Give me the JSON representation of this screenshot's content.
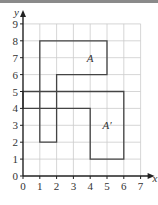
{
  "diagram": {
    "type": "coordinate-grid-transformation",
    "x_axis": {
      "label": "x",
      "ticks": [
        "0",
        "1",
        "2",
        "3",
        "4",
        "5",
        "6",
        "7"
      ],
      "range": [
        0,
        7
      ]
    },
    "y_axis": {
      "label": "y",
      "ticks": [
        "0",
        "1",
        "2",
        "3",
        "4",
        "5",
        "6",
        "7",
        "8",
        "9"
      ],
      "range": [
        0,
        9
      ]
    },
    "grid": true,
    "shapes": [
      {
        "name": "A",
        "label": "A",
        "vertices": [
          [
            1,
            2
          ],
          [
            1,
            8
          ],
          [
            5,
            8
          ],
          [
            5,
            6
          ],
          [
            2,
            6
          ],
          [
            2,
            2
          ]
        ],
        "label_pos": [
          4.0,
          7.0
        ]
      },
      {
        "name": "A'",
        "label": "A′",
        "vertices": [
          [
            0,
            5
          ],
          [
            6,
            5
          ],
          [
            6,
            1
          ],
          [
            4,
            1
          ],
          [
            4,
            4
          ],
          [
            0,
            4
          ]
        ],
        "label_pos": [
          5.0,
          3.0
        ]
      }
    ],
    "colors": {
      "grid": "#cccccc",
      "axis": "#222222",
      "shape": "#444444",
      "topbar": "#8a8a8a"
    }
  }
}
